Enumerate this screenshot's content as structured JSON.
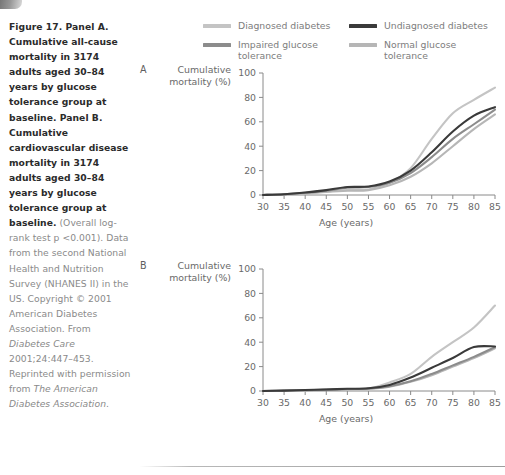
{
  "caption": {
    "bold_part": "Figure 17. Panel A. Cumulative all-cause mortality in 3174 adults aged 30–84 years by glucose tolerance group at baseline. Panel B. Cumulative cardiovascular disease mortality in 3174 adults aged 30–84 years by glucose tolerance group at baseline.",
    "rest_part_1": " (Overall log-rank test p <0.001). Data from the second National Health and Nutrition Survey (NHANES II) in the US. Copyright © 2001 American Diabetes Association. From ",
    "italic_1": "Diabetes Care",
    "rest_part_2": " 2001;24:447–453. Reprinted with permission from ",
    "italic_2": "The American Diabetes Association",
    "rest_part_3": "."
  },
  "legend": {
    "items": [
      {
        "label": "Diagnosed diabetes",
        "color": "#c4c4c4"
      },
      {
        "label": "Undiagnosed diabetes",
        "color": "#3a3a3a"
      },
      {
        "label": "Impaired glucose tolerance",
        "color": "#8c8c8c"
      },
      {
        "label": "Normal glucose tolerance",
        "color": "#b6b6b6"
      }
    ]
  },
  "panels": {
    "a": {
      "letter": "A",
      "y_axis_title": "Cumulative mortality (%)",
      "x_axis_title": "Age (years)"
    },
    "b": {
      "letter": "B",
      "y_axis_title": "Cumulative mortality (%)",
      "x_axis_title": "Age (years)"
    }
  },
  "chart_data": [
    {
      "type": "line",
      "panel": "A",
      "title": "Cumulative all-cause mortality in 3174 adults aged 30–84 years by glucose tolerance group at baseline",
      "xlabel": "Age (years)",
      "ylabel": "Cumulative mortality (%)",
      "xlim": [
        30,
        85
      ],
      "ylim": [
        0,
        100
      ],
      "xticks": [
        30,
        35,
        40,
        45,
        50,
        55,
        60,
        65,
        70,
        75,
        80,
        85
      ],
      "yticks": [
        0,
        20,
        40,
        60,
        80,
        100
      ],
      "grid": false,
      "legend_position": "above-plot",
      "x": [
        30,
        35,
        40,
        45,
        50,
        55,
        60,
        65,
        70,
        75,
        80,
        85
      ],
      "series": [
        {
          "name": "Diagnosed diabetes",
          "color": "#c4c4c4",
          "values": [
            0,
            0.5,
            1.5,
            3,
            4,
            4.5,
            10,
            22,
            46,
            67,
            78,
            88
          ]
        },
        {
          "name": "Undiagnosed diabetes",
          "color": "#3a3a3a",
          "values": [
            0,
            0.6,
            2,
            4,
            6.5,
            7,
            11,
            20,
            35,
            52,
            65,
            72
          ]
        },
        {
          "name": "Impaired glucose tolerance",
          "color": "#8c8c8c",
          "values": [
            0,
            0.6,
            1.8,
            3.5,
            6,
            6.5,
            10,
            18,
            31,
            46,
            58,
            70
          ]
        },
        {
          "name": "Normal glucose tolerance",
          "color": "#b6b6b6",
          "values": [
            0,
            0.4,
            1.2,
            2.5,
            3.5,
            4,
            8,
            15,
            26,
            40,
            54,
            66
          ]
        }
      ]
    },
    {
      "type": "line",
      "panel": "B",
      "title": "Cumulative cardiovascular disease mortality in 3174 adults aged 30–84 years by glucose tolerance group at baseline",
      "xlabel": "Age (years)",
      "ylabel": "Cumulative mortality (%)",
      "xlim": [
        30,
        85
      ],
      "ylim": [
        0,
        100
      ],
      "xticks": [
        30,
        35,
        40,
        45,
        50,
        55,
        60,
        65,
        70,
        75,
        80,
        85
      ],
      "yticks": [
        0,
        20,
        40,
        60,
        80,
        100
      ],
      "grid": false,
      "legend_position": "above-plot",
      "x": [
        30,
        35,
        40,
        45,
        50,
        55,
        60,
        65,
        70,
        75,
        80,
        85
      ],
      "series": [
        {
          "name": "Diagnosed diabetes",
          "color": "#c4c4c4",
          "values": [
            0,
            0.2,
            0.5,
            1,
            1.5,
            2,
            7,
            14,
            28,
            40,
            52,
            70
          ]
        },
        {
          "name": "Undiagnosed diabetes",
          "color": "#3a3a3a",
          "values": [
            0,
            0.3,
            0.8,
            1.2,
            1.8,
            2.2,
            5,
            11,
            19,
            27,
            36,
            36.5
          ]
        },
        {
          "name": "Impaired glucose tolerance",
          "color": "#8c8c8c",
          "values": [
            0,
            0.3,
            0.7,
            1.1,
            1.6,
            2,
            4,
            8,
            14,
            21,
            28,
            36
          ]
        },
        {
          "name": "Normal glucose tolerance",
          "color": "#b6b6b6",
          "values": [
            0,
            0.2,
            0.5,
            0.9,
            1.3,
            1.7,
            3.5,
            7.5,
            13,
            20,
            27,
            35
          ]
        }
      ]
    }
  ]
}
